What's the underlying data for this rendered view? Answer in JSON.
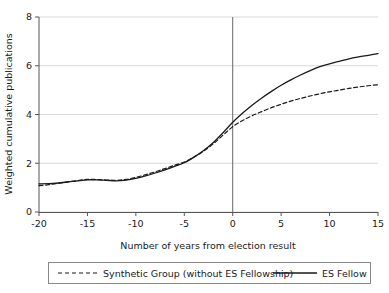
{
  "chart_data": {
    "type": "line",
    "title": "",
    "subtitle": "",
    "xlabel": "Number of years from election result",
    "ylabel": "Weighted cumulative publications",
    "xlim": [
      -20,
      15
    ],
    "ylim": [
      0,
      8
    ],
    "xticks": [
      -20,
      -15,
      -10,
      -5,
      0,
      5,
      10,
      15
    ],
    "xticklabels": [
      "-20",
      "-15",
      "-10",
      "-5",
      "0",
      "5",
      "10",
      "15"
    ],
    "yticks": [
      0,
      2,
      4,
      6,
      8
    ],
    "yticklabels": [
      "0",
      "2",
      "4",
      "6",
      "8"
    ],
    "grid": "horizontal",
    "legend_position": "below-outside",
    "annotations": [
      {
        "name": "election-result-vline",
        "type": "vline",
        "x": 0,
        "label": ""
      }
    ],
    "x": [
      -20,
      -19,
      -18,
      -17,
      -16,
      -15,
      -14,
      -13,
      -12,
      -11,
      -10,
      -9,
      -8,
      -7,
      -6,
      -5,
      -4,
      -3,
      -2,
      -1,
      0,
      1,
      2,
      3,
      4,
      5,
      6,
      7,
      8,
      9,
      10,
      11,
      12,
      13,
      14,
      15
    ],
    "series": [
      {
        "name": "Synthetic Group (without ES Fellowship)",
        "style": "dashed",
        "color": "#1a1a1a",
        "values": [
          1.08,
          1.12,
          1.18,
          1.24,
          1.29,
          1.34,
          1.33,
          1.31,
          1.3,
          1.34,
          1.42,
          1.53,
          1.65,
          1.78,
          1.92,
          2.05,
          2.25,
          2.5,
          2.8,
          3.15,
          3.5,
          3.75,
          3.95,
          4.12,
          4.28,
          4.42,
          4.55,
          4.66,
          4.76,
          4.85,
          4.93,
          5.0,
          5.07,
          5.13,
          5.18,
          5.22
        ]
      },
      {
        "name": "ES Fellow",
        "style": "solid",
        "color": "#1a1a1a",
        "values": [
          1.15,
          1.16,
          1.19,
          1.23,
          1.28,
          1.32,
          1.32,
          1.3,
          1.28,
          1.31,
          1.38,
          1.48,
          1.6,
          1.73,
          1.87,
          2.02,
          2.25,
          2.52,
          2.85,
          3.25,
          3.68,
          4.05,
          4.38,
          4.68,
          4.95,
          5.2,
          5.42,
          5.62,
          5.8,
          5.96,
          6.08,
          6.18,
          6.28,
          6.36,
          6.43,
          6.5
        ]
      }
    ],
    "legend": [
      {
        "label": "Synthetic Group (without ES Fellowship)",
        "style": "dashed"
      },
      {
        "label": "ES Fellow",
        "style": "solid"
      }
    ],
    "colors": {
      "line": "#1a1a1a",
      "grid": "#d9d9d9",
      "axis": "#555555",
      "background": "#ffffff",
      "legend_border": "#888888"
    }
  }
}
